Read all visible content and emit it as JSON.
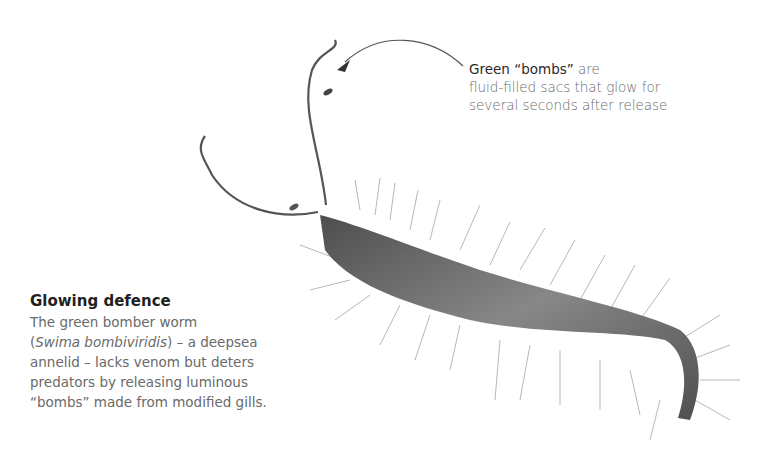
{
  "callout": {
    "highlight": "Green “bombs”",
    "rest_line1": " are",
    "line2": "fluid-filled sacs that glow for",
    "line3": "several seconds after release"
  },
  "caption": {
    "title": "Glowing defence",
    "line1": "The green bomber worm",
    "line2_open": "(",
    "line2_italic": "Swima bombiviridis",
    "line2_rest": ") – a deepsea",
    "line3": "annelid – lacks venom but deters",
    "line4": "predators by releasing luminous",
    "line5": "“bombs” made from modified gills."
  },
  "illustration": {
    "subject": "green-bomber-worm",
    "body_color": "#5a5a5a",
    "bristle_color": "#b5b5b5",
    "arrow_color": "#444444"
  }
}
